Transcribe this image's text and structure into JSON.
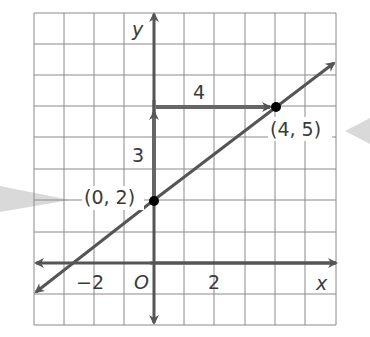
{
  "graph": {
    "axis_labels": {
      "x": "x",
      "y": "y",
      "origin": "O"
    },
    "tick_labels": {
      "x_neg2": "−2",
      "x_2": "2"
    },
    "points": [
      {
        "label": "(0, 2)",
        "x": 0,
        "y": 2
      },
      {
        "label": "(4, 5)",
        "x": 4,
        "y": 5
      }
    ],
    "rise_label": "3",
    "run_label": "4",
    "colors": {
      "grid": "#8a8a8a",
      "line": "#5a5a5a",
      "point": "#000000",
      "callout": "#d6d6d6"
    }
  }
}
